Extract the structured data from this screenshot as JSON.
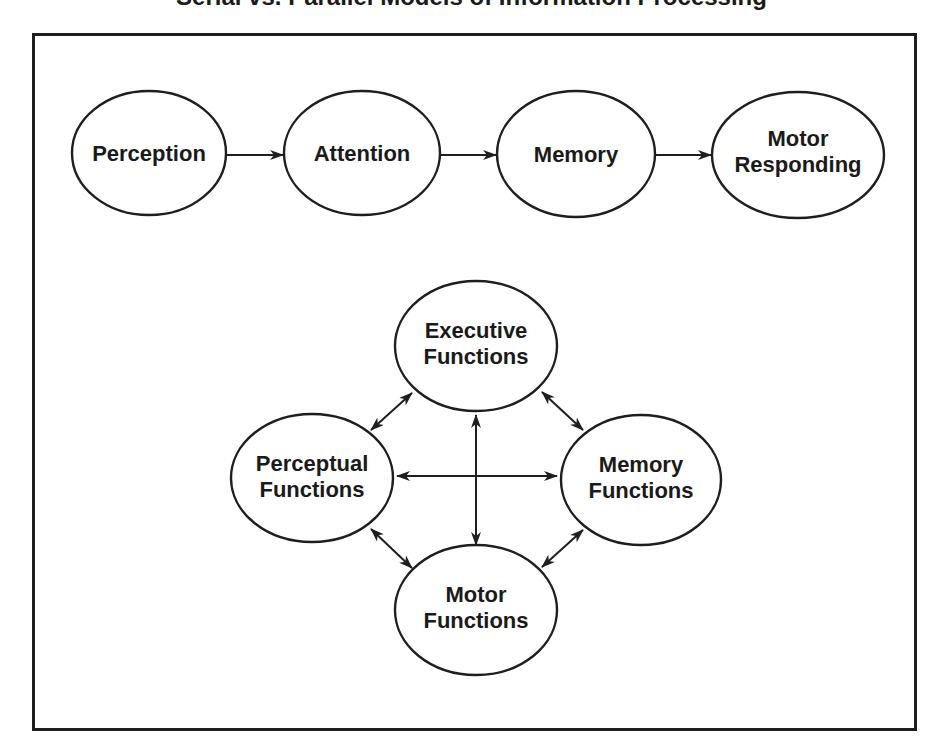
{
  "diagram": {
    "title_cropped": "Serial vs. Parallel Models of Information Processing",
    "colors": {
      "stroke": "#1e1e1e",
      "text": "#1a1a1a",
      "background": "#ffffff"
    },
    "serial_model": {
      "nodes": [
        {
          "id": "perception",
          "lines": [
            "Perception"
          ]
        },
        {
          "id": "attention",
          "lines": [
            "Attention"
          ]
        },
        {
          "id": "memory",
          "lines": [
            "Memory"
          ]
        },
        {
          "id": "motor-responding",
          "lines": [
            "Motor",
            "Responding"
          ]
        }
      ],
      "edges": [
        {
          "from": "perception",
          "to": "attention",
          "type": "one-way"
        },
        {
          "from": "attention",
          "to": "memory",
          "type": "one-way"
        },
        {
          "from": "memory",
          "to": "motor-responding",
          "type": "one-way"
        }
      ]
    },
    "parallel_model": {
      "nodes": [
        {
          "id": "executive-functions",
          "lines": [
            "Executive",
            "Functions"
          ]
        },
        {
          "id": "perceptual-functions",
          "lines": [
            "Perceptual",
            "Functions"
          ]
        },
        {
          "id": "memory-functions",
          "lines": [
            "Memory",
            "Functions"
          ]
        },
        {
          "id": "motor-functions",
          "lines": [
            "Motor",
            "Functions"
          ]
        }
      ],
      "edges": [
        {
          "from": "executive-functions",
          "to": "perceptual-functions",
          "type": "two-way"
        },
        {
          "from": "executive-functions",
          "to": "memory-functions",
          "type": "two-way"
        },
        {
          "from": "executive-functions",
          "to": "motor-functions",
          "type": "two-way"
        },
        {
          "from": "perceptual-functions",
          "to": "memory-functions",
          "type": "two-way"
        },
        {
          "from": "perceptual-functions",
          "to": "motor-functions",
          "type": "two-way"
        },
        {
          "from": "memory-functions",
          "to": "motor-functions",
          "type": "two-way"
        }
      ]
    }
  }
}
